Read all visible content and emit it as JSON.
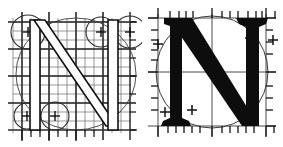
{
  "figure": {
    "subject_letter": "N",
    "panel_count": 2,
    "background_color": "#ffffff",
    "ink_color": "#1a1a1a",
    "grid_color": "#555555",
    "guide_color": "#4a4a4a"
  },
  "panels": [
    {
      "id": "outline-panel",
      "name": "skeleton-construction",
      "label": "Outlined N with construction grid",
      "letter": "N",
      "rendering": "outline",
      "has_fine_grid": true,
      "grid_spacing_px": 9,
      "construction_circles": [
        {
          "name": "top-left-circle",
          "cx": 28,
          "cy": 32,
          "r": 17,
          "marker": "+"
        },
        {
          "name": "top-right-circle",
          "cx": 101,
          "cy": 32,
          "r": 15,
          "marker": "+"
        },
        {
          "name": "far-right-circle",
          "cx": 130,
          "cy": 32,
          "r": 16,
          "marker": "+"
        },
        {
          "name": "bottom-left-circle",
          "cx": 27,
          "cy": 116,
          "r": 13,
          "marker": "+"
        },
        {
          "name": "bottom-mid-circle",
          "cx": 55,
          "cy": 116,
          "r": 14,
          "marker": "+"
        }
      ],
      "large_arc": {
        "name": "inscribing-ellipse",
        "cx": 76,
        "cy": 74,
        "rx": 60,
        "ry": 56
      },
      "marker_glyph": "+",
      "marker_count": 5
    },
    {
      "id": "solid-panel",
      "name": "finished-letterform",
      "label": "Solid serif N with measurement guides",
      "letter": "N",
      "rendering": "solid",
      "has_fine_grid": false,
      "construction_circles": [
        {
          "name": "inscribing-circle",
          "cx": 70,
          "cy": 72,
          "r": 56,
          "marker": "none"
        }
      ],
      "cross_markers": [
        {
          "name": "upper-left-cross",
          "x": 16,
          "y": 44,
          "glyph": "+"
        },
        {
          "name": "upper-right-cross",
          "x": 108,
          "y": 38,
          "glyph": "+"
        },
        {
          "name": "far-right-cross",
          "x": 131,
          "y": 40,
          "glyph": "+"
        },
        {
          "name": "lower-left-cross",
          "x": 23,
          "y": 112,
          "glyph": "+"
        },
        {
          "name": "lower-mid-cross",
          "x": 50,
          "y": 110,
          "glyph": "+"
        }
      ],
      "marker_glyph": "+",
      "marker_count": 5,
      "tick_axes": [
        "top",
        "bottom",
        "left",
        "right"
      ]
    }
  ],
  "axes": {
    "left_panel": {
      "bottom_tick_count": 9,
      "right_tick_count": 7
    },
    "right_panel": {
      "top_tick_count": 14,
      "bottom_tick_count": 15,
      "left_tick_count": 9,
      "right_tick_count": 9
    }
  }
}
